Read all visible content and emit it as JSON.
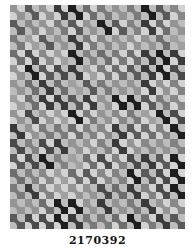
{
  "image": {
    "subject": "bow-tie pattern quilt photograph (grayscale)",
    "caption": "2170392",
    "grid": {
      "columns": 12,
      "rows": 15
    },
    "shades": [
      "#3a3a3a",
      "#5a5a5a",
      "#6e6e6e",
      "#828282",
      "#949494",
      "#1e1e1e",
      "#7a7a7a",
      "#a0a0a0",
      "#4a4a4a",
      "#888888"
    ],
    "light": "#d2d2d2"
  }
}
